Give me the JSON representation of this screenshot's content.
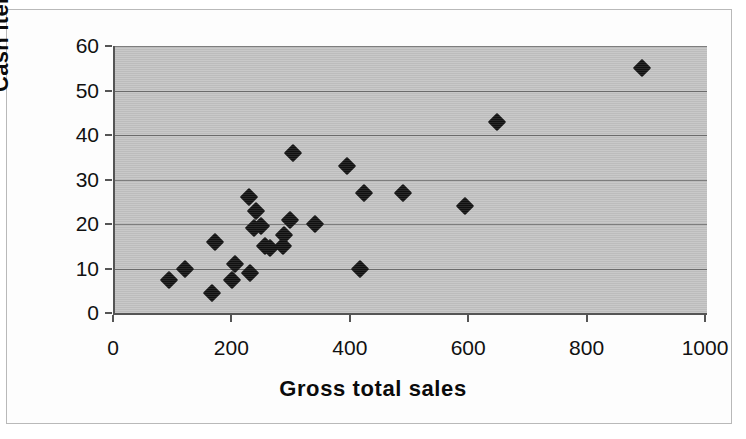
{
  "chart_data": {
    "type": "scatter",
    "title": "",
    "xlabel": "Gross total sales",
    "ylabel": "Cash items",
    "xlim": [
      0,
      1000
    ],
    "ylim": [
      0,
      60
    ],
    "xticks": [
      0,
      200,
      400,
      600,
      800,
      1000
    ],
    "yticks": [
      0,
      10,
      20,
      30,
      40,
      50,
      60
    ],
    "xtick_labels": [
      "0",
      "200",
      "400",
      "600",
      "800",
      "1000"
    ],
    "ytick_labels": [
      "0",
      "10",
      "20",
      "30",
      "40",
      "50",
      "60"
    ],
    "grid": "horizontal",
    "legend": "none",
    "marker": "diamond",
    "marker_color": "#111111",
    "plot_background": "#c3c3c3",
    "gridline_color": "#6f6f6f",
    "axis_color": "#555555",
    "points": [
      {
        "x": 91,
        "y": 7.5
      },
      {
        "x": 118,
        "y": 10.0
      },
      {
        "x": 164,
        "y": 4.5
      },
      {
        "x": 169,
        "y": 16.0
      },
      {
        "x": 198,
        "y": 7.5
      },
      {
        "x": 203,
        "y": 11.0
      },
      {
        "x": 228,
        "y": 9.0
      },
      {
        "x": 226,
        "y": 26.0
      },
      {
        "x": 238,
        "y": 23.0
      },
      {
        "x": 235,
        "y": 19.0
      },
      {
        "x": 247,
        "y": 19.5
      },
      {
        "x": 253,
        "y": 15.0
      },
      {
        "x": 262,
        "y": 14.5
      },
      {
        "x": 284,
        "y": 15.0
      },
      {
        "x": 285,
        "y": 17.5
      },
      {
        "x": 296,
        "y": 21.0
      },
      {
        "x": 301,
        "y": 36.0
      },
      {
        "x": 338,
        "y": 20.0
      },
      {
        "x": 392,
        "y": 33.0
      },
      {
        "x": 414,
        "y": 10.0
      },
      {
        "x": 420,
        "y": 27.0
      },
      {
        "x": 486,
        "y": 27.0
      },
      {
        "x": 591,
        "y": 24.0
      },
      {
        "x": 645,
        "y": 43.0
      },
      {
        "x": 890,
        "y": 55.0
      }
    ]
  }
}
